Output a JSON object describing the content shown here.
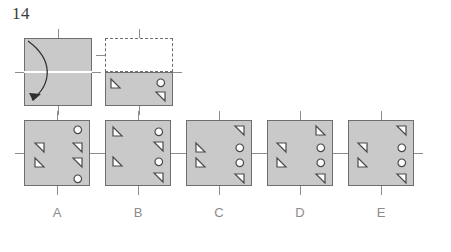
{
  "question": {
    "number": "14",
    "type": "paper-folding-punch-puzzle"
  },
  "colors": {
    "paper_fill": "#c9c9c9",
    "paper_stroke": "#6e6e6e",
    "fold_line": "#ffffff",
    "tick": "#8d8d8d",
    "label_text": "#8c8c8c",
    "number_text": "#3a3a3a",
    "hole_fill": "#ffffff",
    "hole_stroke": "#4a4a4a",
    "background": "#ffffff"
  },
  "prompt": {
    "step1": {
      "name": "unfolded-sheet-with-fold-arrow",
      "shape": "square",
      "fold_direction": "top-edge-folds-down-to-bottom",
      "fold_line": "horizontal-midline",
      "arrow": "curved-arrow-down"
    },
    "step2": {
      "name": "folded-sheet-with-punches",
      "folded_away": "top-half-shown-dashed",
      "visible_half": "bottom-half",
      "punches": [
        {
          "id": "p1",
          "shape": "triangle",
          "orient": "right-angle-top-left",
          "x_pct": 14,
          "y_pct": 30
        },
        {
          "id": "p2",
          "shape": "circle",
          "x_pct": 80,
          "y_pct": 28
        },
        {
          "id": "p3",
          "shape": "triangle",
          "orient": "right-angle-top-right",
          "x_pct": 80,
          "y_pct": 70
        }
      ]
    }
  },
  "options": [
    {
      "label": "A",
      "name": "option-a",
      "holes": [
        {
          "shape": "circle",
          "x_pct": 80,
          "y_pct": 14
        },
        {
          "shape": "triangle",
          "orient": "right-angle-top-right",
          "x_pct": 22,
          "y_pct": 40
        },
        {
          "shape": "triangle",
          "orient": "right-angle-top-right",
          "x_pct": 80,
          "y_pct": 40
        },
        {
          "shape": "triangle",
          "orient": "right-angle-top-left",
          "x_pct": 22,
          "y_pct": 63
        },
        {
          "shape": "triangle",
          "orient": "right-angle-top-right",
          "x_pct": 80,
          "y_pct": 63
        },
        {
          "shape": "circle",
          "x_pct": 80,
          "y_pct": 87
        }
      ]
    },
    {
      "label": "B",
      "name": "option-b",
      "holes": [
        {
          "shape": "triangle",
          "orient": "right-angle-top-left",
          "x_pct": 18,
          "y_pct": 16
        },
        {
          "shape": "circle",
          "x_pct": 80,
          "y_pct": 16
        },
        {
          "shape": "triangle",
          "orient": "right-angle-top-right",
          "x_pct": 80,
          "y_pct": 38
        },
        {
          "shape": "triangle",
          "orient": "right-angle-top-left",
          "x_pct": 18,
          "y_pct": 62
        },
        {
          "shape": "circle",
          "x_pct": 80,
          "y_pct": 62
        },
        {
          "shape": "triangle",
          "orient": "right-angle-top-right",
          "x_pct": 80,
          "y_pct": 85
        }
      ]
    },
    {
      "label": "C",
      "name": "option-c",
      "holes": [
        {
          "shape": "triangle",
          "orient": "right-angle-top-right",
          "x_pct": 80,
          "y_pct": 14
        },
        {
          "shape": "triangle",
          "orient": "right-angle-top-left",
          "x_pct": 20,
          "y_pct": 40
        },
        {
          "shape": "circle",
          "x_pct": 80,
          "y_pct": 40
        },
        {
          "shape": "triangle",
          "orient": "right-angle-top-left",
          "x_pct": 20,
          "y_pct": 63
        },
        {
          "shape": "circle",
          "x_pct": 80,
          "y_pct": 63
        },
        {
          "shape": "triangle",
          "orient": "right-angle-top-right",
          "x_pct": 80,
          "y_pct": 87
        }
      ]
    },
    {
      "label": "D",
      "name": "option-d",
      "holes": [
        {
          "shape": "triangle",
          "orient": "right-angle-top-left",
          "x_pct": 80,
          "y_pct": 14
        },
        {
          "shape": "triangle",
          "orient": "right-angle-top-right",
          "x_pct": 20,
          "y_pct": 40
        },
        {
          "shape": "circle",
          "x_pct": 80,
          "y_pct": 40
        },
        {
          "shape": "triangle",
          "orient": "right-angle-top-left",
          "x_pct": 20,
          "y_pct": 63
        },
        {
          "shape": "circle",
          "x_pct": 80,
          "y_pct": 63
        },
        {
          "shape": "triangle",
          "orient": "right-angle-top-right",
          "x_pct": 80,
          "y_pct": 87
        }
      ]
    },
    {
      "label": "E",
      "name": "option-e",
      "holes": [
        {
          "shape": "triangle",
          "orient": "right-angle-top-right",
          "x_pct": 80,
          "y_pct": 14
        },
        {
          "shape": "triangle",
          "orient": "right-angle-top-right",
          "x_pct": 20,
          "y_pct": 40
        },
        {
          "shape": "circle",
          "x_pct": 80,
          "y_pct": 40
        },
        {
          "shape": "triangle",
          "orient": "right-angle-top-left",
          "x_pct": 20,
          "y_pct": 63
        },
        {
          "shape": "circle",
          "x_pct": 80,
          "y_pct": 63
        },
        {
          "shape": "triangle",
          "orient": "right-angle-top-right",
          "x_pct": 80,
          "y_pct": 87
        }
      ]
    }
  ],
  "layout": {
    "prompt_row": {
      "top": 38,
      "square_size": 68
    },
    "option_row": {
      "top": 120,
      "square_size": 66,
      "left_start": 24,
      "pitch": 81
    },
    "label_row_top": 205
  }
}
